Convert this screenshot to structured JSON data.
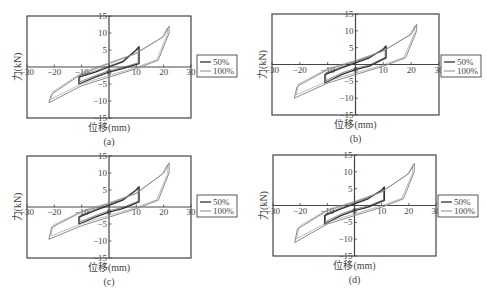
{
  "figure": {
    "panels": [
      {
        "id": "a",
        "caption": "(a)",
        "xlabel": "位移(mm)",
        "ylabel": "力(kN)",
        "frame": {
          "x": 27,
          "y": 16,
          "w": 164,
          "h": 102
        },
        "legend": {
          "x": 197,
          "y": 55
        }
      },
      {
        "id": "b",
        "caption": "(b)",
        "xlabel": "位移(mm)",
        "ylabel": "力(kN)",
        "frame": {
          "x": 272,
          "y": 14,
          "w": 167,
          "h": 101
        },
        "legend": {
          "x": 441,
          "y": 55
        }
      },
      {
        "id": "c",
        "caption": "(c)",
        "xlabel": "位移(mm)",
        "ylabel": "力(kN)",
        "frame": {
          "x": 27,
          "y": 156,
          "w": 164,
          "h": 102
        },
        "legend": {
          "x": 197,
          "y": 195
        }
      },
      {
        "id": "d",
        "caption": "(d)",
        "xlabel": "位移(mm)",
        "ylabel": "力(kN)",
        "frame": {
          "x": 273,
          "y": 155,
          "w": 163,
          "h": 101
        },
        "legend": {
          "x": 438,
          "y": 195
        }
      }
    ],
    "legend_labels": [
      "50%",
      "100%"
    ],
    "colors": {
      "series_50": "#333333",
      "series_100": "#8a8a8a",
      "axis": "#444444"
    }
  },
  "chart_data": [
    {
      "type": "line",
      "title": "(a)",
      "xlabel": "位移(mm)",
      "ylabel": "力(kN)",
      "xlim": [
        -30,
        30
      ],
      "ylim": [
        -15,
        15
      ],
      "xticks": [
        -30,
        -20,
        -10,
        0,
        10,
        20,
        30
      ],
      "yticks": [
        -15,
        -10,
        -5,
        0,
        5,
        10,
        15
      ],
      "legend": [
        "50%",
        "100%"
      ],
      "legend_position": "right",
      "series": [
        {
          "name": "50%",
          "x": [
            -11,
            -11,
            -5,
            0,
            5,
            10,
            11,
            11,
            5,
            0,
            -5,
            -11
          ],
          "y": [
            -5,
            -3,
            -1.5,
            0,
            1.5,
            5,
            6,
            1,
            -0.5,
            -1.5,
            -3,
            -5
          ]
        },
        {
          "name": "100%",
          "x": [
            -22,
            -21,
            -10,
            0,
            10,
            20,
            22,
            22,
            18,
            10,
            0,
            -10,
            -22
          ],
          "y": [
            -10.5,
            -8,
            -2,
            1,
            4,
            9,
            12,
            10,
            2,
            -0.5,
            -3,
            -5.5,
            -10.5
          ]
        }
      ]
    },
    {
      "type": "line",
      "title": "(b)",
      "xlabel": "位移(mm)",
      "ylabel": "力(kN)",
      "xlim": [
        -30,
        30
      ],
      "ylim": [
        -15,
        15
      ],
      "xticks": [
        -30,
        -20,
        -10,
        0,
        10,
        20,
        30
      ],
      "yticks": [
        -15,
        -10,
        -5,
        0,
        5,
        10,
        15
      ],
      "legend": [
        "50%",
        "100%"
      ],
      "legend_position": "right",
      "series": [
        {
          "name": "50%",
          "x": [
            -11,
            -11,
            -5,
            0,
            5,
            10,
            11,
            11,
            5,
            0,
            -5,
            -11
          ],
          "y": [
            -5.5,
            -3,
            -1,
            0.5,
            2,
            4.5,
            5.5,
            2,
            -0.5,
            -1.5,
            -3,
            -5.5
          ]
        },
        {
          "name": "100%",
          "x": [
            -22,
            -21,
            -10,
            0,
            10,
            20,
            22,
            22,
            18,
            10,
            0,
            -10,
            -22
          ],
          "y": [
            -10,
            -6.5,
            -1.5,
            1,
            4,
            9,
            12,
            10,
            2,
            -0.5,
            -3,
            -5.5,
            -10
          ]
        }
      ]
    },
    {
      "type": "line",
      "title": "(c)",
      "xlabel": "位移(mm)",
      "ylabel": "力(kN)",
      "xlim": [
        -30,
        30
      ],
      "ylim": [
        -15,
        15
      ],
      "xticks": [
        -30,
        -20,
        -10,
        0,
        10,
        20,
        30
      ],
      "yticks": [
        -15,
        -10,
        -5,
        0,
        5,
        10,
        15
      ],
      "legend": [
        "50%",
        "100%"
      ],
      "legend_position": "right",
      "series": [
        {
          "name": "50%",
          "x": [
            -11,
            -11,
            -5,
            0,
            5,
            10,
            11,
            11,
            5,
            0,
            -5,
            -11
          ],
          "y": [
            -5,
            -3,
            -1,
            0.5,
            2,
            5,
            6,
            1.5,
            -0.5,
            -1.5,
            -3,
            -5
          ]
        },
        {
          "name": "100%",
          "x": [
            -22,
            -21,
            -10,
            0,
            10,
            20,
            22,
            22,
            18,
            10,
            0,
            -10,
            -22
          ],
          "y": [
            -9.5,
            -6,
            -1.5,
            1,
            4,
            10,
            13,
            10,
            2,
            -0.5,
            -3,
            -5.5,
            -9.5
          ]
        }
      ]
    },
    {
      "type": "line",
      "title": "(d)",
      "xlabel": "位移(mm)",
      "ylabel": "力(kN)",
      "xlim": [
        -30,
        30
      ],
      "ylim": [
        -15,
        15
      ],
      "xticks": [
        -30,
        -20,
        -10,
        0,
        10,
        20,
        30
      ],
      "yticks": [
        -15,
        -10,
        -5,
        0,
        5,
        10,
        15
      ],
      "legend": [
        "50%",
        "100%"
      ],
      "legend_position": "right",
      "series": [
        {
          "name": "50%",
          "x": [
            -11,
            -11,
            -5,
            0,
            5,
            10,
            11,
            11,
            5,
            0,
            -5,
            -11
          ],
          "y": [
            -5.5,
            -3,
            -1,
            0.5,
            2,
            4.5,
            5.5,
            1.5,
            -0.5,
            -1.5,
            -3,
            -5.5
          ]
        },
        {
          "name": "100%",
          "x": [
            -22,
            -21,
            -10,
            0,
            10,
            20,
            22,
            22,
            18,
            10,
            0,
            -10,
            -22
          ],
          "y": [
            -11,
            -7,
            -1.5,
            1,
            4,
            9.5,
            12.5,
            10,
            2,
            -0.5,
            -3,
            -5.5,
            -11
          ]
        }
      ]
    }
  ]
}
